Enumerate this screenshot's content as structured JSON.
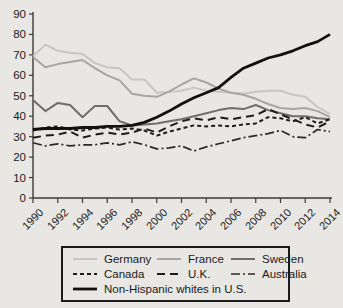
{
  "chart_data": {
    "type": "line",
    "title": "",
    "x": [
      1990,
      1991,
      1992,
      1993,
      1994,
      1995,
      1996,
      1997,
      1998,
      1999,
      2000,
      2001,
      2002,
      2003,
      2004,
      2005,
      2006,
      2007,
      2008,
      2009,
      2010,
      2011,
      2012,
      2013,
      2014
    ],
    "x_tick_labels": [
      "1990",
      "1992",
      "1994",
      "1996",
      "1998",
      "2000",
      "2002",
      "2004",
      "2006",
      "2008",
      "2010",
      "2012",
      "2014"
    ],
    "y_ticks": [
      0,
      10,
      20,
      30,
      40,
      50,
      60,
      70,
      80,
      90
    ],
    "ylim": [
      0,
      90
    ],
    "grid": false,
    "legend_position": "bottom-box",
    "series": [
      {
        "name": "Germany",
        "color": "#c6c6c6",
        "style": "solid",
        "width": 2,
        "values": [
          69.5,
          75,
          72,
          71,
          70.5,
          66,
          64,
          63.5,
          58,
          58,
          51.5,
          52,
          52.5,
          54,
          52.5,
          52,
          51.5,
          51,
          52,
          52.5,
          52.5,
          50.5,
          49.5,
          44.5,
          41
        ]
      },
      {
        "name": "France",
        "color": "#a6a6a6",
        "style": "solid",
        "width": 2,
        "values": [
          69,
          64,
          65.5,
          66.5,
          67.5,
          63.5,
          60,
          57.5,
          51,
          50,
          49.5,
          52,
          55.5,
          58.5,
          56.5,
          53.5,
          51.5,
          50.5,
          48.5,
          46,
          44,
          43.5,
          44,
          42.5,
          39.5
        ]
      },
      {
        "name": "Sweden",
        "color": "#6e6e6e",
        "style": "solid",
        "width": 2,
        "values": [
          48,
          42.5,
          46.5,
          45.5,
          39.5,
          45,
          45,
          37.5,
          35.5,
          36,
          36.5,
          37.5,
          38.5,
          40,
          41.5,
          43,
          44,
          43.5,
          45.5,
          43,
          41.5,
          40,
          40,
          39,
          38.5
        ]
      },
      {
        "name": "Canada",
        "color": "#1c1c1c",
        "style": "short-dash",
        "width": 2,
        "values": [
          33,
          34.5,
          35,
          33.5,
          33,
          34,
          34.5,
          33.5,
          34,
          33,
          30.5,
          32.5,
          34,
          35.5,
          35,
          35.5,
          35,
          36,
          36.5,
          39.5,
          39,
          37.5,
          39.5,
          36.5,
          38.5
        ]
      },
      {
        "name": "U.K.",
        "color": "#1c1c1c",
        "style": "dash",
        "width": 2,
        "values": [
          29.5,
          30.5,
          31,
          32.5,
          29.5,
          31,
          32,
          31,
          32,
          34,
          32,
          35,
          37.5,
          39,
          38,
          39.5,
          38.5,
          39.5,
          40.5,
          43.5,
          41,
          38.5,
          36,
          34.5,
          37.5
        ]
      },
      {
        "name": "Australia",
        "color": "#2a2a2a",
        "style": "dash-dot",
        "width": 1.7,
        "values": [
          27,
          25.5,
          26.5,
          25.5,
          26,
          26,
          27,
          26,
          27.5,
          26,
          24,
          24.5,
          25.5,
          23,
          25,
          26.5,
          28,
          29.5,
          30.5,
          31.5,
          33,
          30,
          29.5,
          33.5,
          32.5
        ]
      },
      {
        "name": "Non-Hispanic whites in U.S.",
        "color": "#111111",
        "style": "solid",
        "width": 2.8,
        "values": [
          33.5,
          34,
          34,
          34,
          34.5,
          34.5,
          35,
          35,
          35.5,
          37,
          39.5,
          42.5,
          46,
          49,
          51.5,
          54,
          59,
          63.5,
          66,
          68.5,
          70,
          72,
          74.5,
          76.5,
          80
        ]
      }
    ]
  },
  "colors": {
    "background": "#e9e7e3",
    "axis": "#3a3a3a",
    "text": "#1a1a1a",
    "legend_border": "#1a1a1a"
  }
}
